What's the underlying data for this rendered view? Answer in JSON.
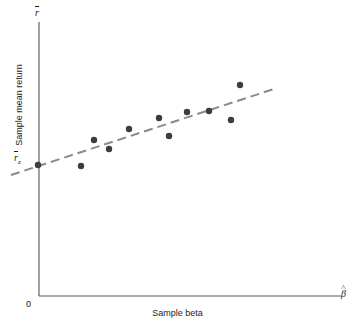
{
  "figure": {
    "axis_color": "#555555",
    "point_color": "#3d3d3d",
    "fit_line_color": "#8a8a8a",
    "background": "#ffffff"
  },
  "labels": {
    "y_axis_title": "Sample mean return",
    "x_axis_title": "Sample beta",
    "y_axis_end_symbol": "r",
    "x_axis_end_symbol": "β",
    "intercept_symbol": "r",
    "intercept_subscript": "z",
    "origin": "0"
  },
  "chart_data": {
    "type": "scatter",
    "title": "",
    "xlabel": "Sample beta",
    "ylabel": "Sample mean return",
    "xlim": [
      0,
      1
    ],
    "ylim": [
      0,
      1
    ],
    "grid": false,
    "legend": "none",
    "axis_end_labels": {
      "y": "r-bar",
      "x": "beta-hat"
    },
    "annotations": [
      {
        "text": "r-bar sub z",
        "meaning": "zero-beta intercept of fitted line on vertical axis",
        "x_px": 38,
        "y_px": 165
      },
      {
        "text": "0",
        "meaning": "origin",
        "x_px": 30,
        "y_px": 304
      }
    ],
    "points_px": [
      {
        "x": 38,
        "y": 165
      },
      {
        "x": 81,
        "y": 166
      },
      {
        "x": 94,
        "y": 140
      },
      {
        "x": 109,
        "y": 149
      },
      {
        "x": 129,
        "y": 129
      },
      {
        "x": 159,
        "y": 118
      },
      {
        "x": 169,
        "y": 136
      },
      {
        "x": 187,
        "y": 112
      },
      {
        "x": 209,
        "y": 111
      },
      {
        "x": 231,
        "y": 120
      },
      {
        "x": 240,
        "y": 85
      }
    ],
    "x": [
      0.0,
      0.143,
      0.186,
      0.236,
      0.303,
      0.402,
      0.436,
      0.495,
      0.568,
      0.641,
      0.671
    ],
    "y": [
      0.479,
      0.475,
      0.57,
      0.537,
      0.61,
      0.65,
      0.584,
      0.672,
      0.675,
      0.643,
      0.77
    ],
    "series": [
      {
        "name": "Securities (sample portfolios)",
        "marker": "filled-circle",
        "marker_radius_px": 3.2,
        "color": "#3d3d3d",
        "x": [
          0.0,
          0.143,
          0.186,
          0.236,
          0.303,
          0.402,
          0.436,
          0.495,
          0.568,
          0.641,
          0.671
        ],
        "y": [
          0.479,
          0.475,
          0.57,
          0.537,
          0.61,
          0.65,
          0.584,
          0.672,
          0.675,
          0.643,
          0.77
        ]
      }
    ],
    "fit_line": {
      "name": "Fitted empirical security market line",
      "style": "dashed",
      "color": "#8a8a8a",
      "width_px": 2,
      "dash_px": [
        9,
        5
      ],
      "endpoints_px": [
        {
          "x": 11,
          "y": 175
        },
        {
          "x": 277,
          "y": 88
        }
      ],
      "intercept_px": {
        "x": 38,
        "y": 165
      },
      "slope_sign": "positive"
    },
    "axes_px": {
      "y_axis": {
        "x": 39,
        "y_top": 22,
        "y_bottom": 296
      },
      "x_axis": {
        "y": 296,
        "x_left": 39,
        "x_right": 341
      }
    }
  }
}
